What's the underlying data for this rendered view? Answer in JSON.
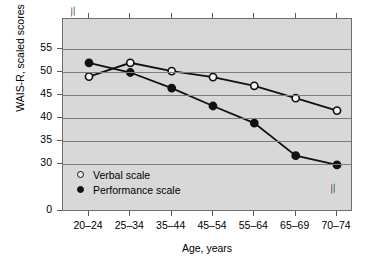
{
  "chart_data": {
    "type": "line",
    "title": "",
    "xlabel": "Age, years",
    "ylabel": "WAIS-R, scaled scores",
    "categories": [
      "20–24",
      "25–34",
      "35–44",
      "45–54",
      "55–64",
      "65–69",
      "70–74"
    ],
    "ytick_labels": [
      "55",
      "50",
      "45",
      "40",
      "35",
      "30",
      "0"
    ],
    "ytick_values": [
      55,
      50,
      45,
      40,
      35,
      30,
      0
    ],
    "ylim": [
      28,
      57
    ],
    "grid": "horizontal",
    "axis_break": "//",
    "legend_position": "inside lower-left",
    "series": [
      {
        "name": "Verbal scale",
        "marker": "open-circle",
        "color": "#111111",
        "values": [
          49.0,
          52.0,
          50.2,
          48.9,
          47.0,
          44.3,
          41.6
        ]
      },
      {
        "name": "Performance scale",
        "marker": "filled-circle",
        "color": "#111111",
        "values": [
          52.0,
          49.9,
          46.5,
          42.6,
          38.9,
          31.8,
          29.8
        ]
      }
    ]
  },
  "legend": {
    "items": [
      {
        "label": "Verbal scale",
        "marker": "open-circle"
      },
      {
        "label": "Performance scale",
        "marker": "filled-circle"
      }
    ]
  },
  "colors": {
    "plot_background": "#d8d8d8",
    "gridline": "#7c7c7c",
    "axis": "#6e6e6e",
    "ink": "#111111",
    "page_background": "#ffffff"
  },
  "marks": {
    "break_top_left": "//",
    "break_bottom_right": "//"
  }
}
